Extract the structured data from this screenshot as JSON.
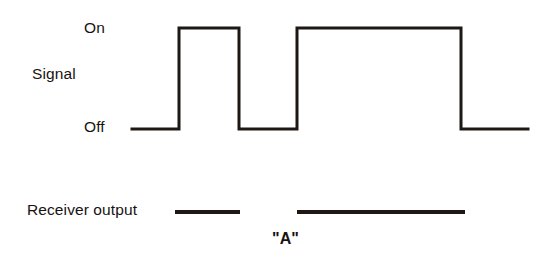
{
  "figure": {
    "background_color": "#ffffff",
    "ink_color": "#1f1713",
    "width": 539,
    "height": 275
  },
  "labels": {
    "on": "On",
    "signal": "Signal",
    "off": "Off",
    "receiver_output": "Receiver output",
    "decoded_character": "\"A\""
  },
  "chart_data": {
    "type": "line",
    "title": "",
    "subtitle": "",
    "xlabel": "",
    "ylabel": "Signal",
    "grid": false,
    "legend": "none",
    "y_tick_labels": [
      "Off",
      "On"
    ],
    "y_levels": {
      "off": 0,
      "on": 1
    },
    "xlim": [
      132,
      528
    ],
    "ylim": [
      0,
      1
    ],
    "series": [
      {
        "name": "Signal",
        "type": "square-wave",
        "stroke_width": 3,
        "points": [
          {
            "x": 132,
            "y": 0
          },
          {
            "x": 179,
            "y": 0
          },
          {
            "x": 179,
            "y": 1
          },
          {
            "x": 239,
            "y": 1
          },
          {
            "x": 239,
            "y": 0
          },
          {
            "x": 297,
            "y": 0
          },
          {
            "x": 297,
            "y": 1
          },
          {
            "x": 461,
            "y": 1
          },
          {
            "x": 461,
            "y": 0
          },
          {
            "x": 528,
            "y": 0
          }
        ],
        "pulses": [
          {
            "index": 1,
            "start_x": 179,
            "end_x": 239,
            "width": 60,
            "kind": "short"
          },
          {
            "index": 2,
            "start_x": 297,
            "end_x": 461,
            "width": 164,
            "kind": "long"
          }
        ]
      },
      {
        "name": "Receiver output",
        "type": "segments",
        "stroke_width": 4,
        "y": 212,
        "segments": [
          {
            "index": 1,
            "start_x": 175,
            "end_x": 240,
            "length": 65,
            "kind": "dot"
          },
          {
            "index": 2,
            "start_x": 297,
            "end_x": 465,
            "length": 168,
            "kind": "dash"
          }
        ]
      }
    ],
    "annotations": [
      {
        "text": "\"A\"",
        "x": 295,
        "y": 241,
        "describes": "morse-code-character"
      }
    ]
  }
}
